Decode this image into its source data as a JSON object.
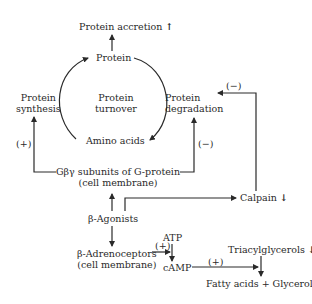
{
  "diagram": {
    "nodes": {
      "protein_accretion": {
        "label": "Protein accretion",
        "trend": "↑"
      },
      "protein": {
        "label": "Protein"
      },
      "protein_synthesis": {
        "line1": "Protein",
        "line2": "synthesis"
      },
      "protein_turnover": {
        "line1": "Protein",
        "line2": "turnover"
      },
      "protein_degradation": {
        "line1": "Protein",
        "line2": "degradation"
      },
      "amino_acids": {
        "label": "Amino acids"
      },
      "gby": {
        "line1": "Gβγ subunits of G-protein",
        "line2": "(cell membrane)"
      },
      "calpain": {
        "label": "Calpain",
        "trend": "↓"
      },
      "b_agonists": {
        "label": "β-Agonists"
      },
      "atp": {
        "label": "ATP"
      },
      "b_adrenoceptors": {
        "line1": "β-Adrenoceptors",
        "line2": "(cell membrane)"
      },
      "camp": {
        "label": "cAMP"
      },
      "triacylglycerols": {
        "label": "Triacylglycerols",
        "trend": "↓"
      },
      "fatty_acids": {
        "label": "Fatty acids + Glycerol"
      }
    },
    "effects": {
      "calpain_to_degradation": "(−)",
      "gby_to_synthesis": "(+)",
      "gby_to_degradation": "(−)",
      "adrenoceptors_to_camp": "(+)",
      "camp_to_lipolysis": "(+)"
    }
  }
}
